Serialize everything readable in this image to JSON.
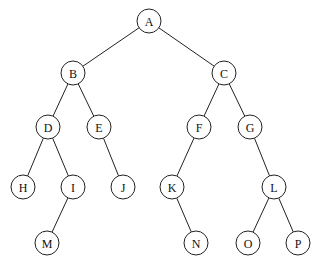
{
  "diagram": {
    "type": "binary-tree",
    "nodes": [
      {
        "id": "A",
        "label": "A",
        "x": 149,
        "y": 21
      },
      {
        "id": "B",
        "label": "B",
        "x": 73,
        "y": 73
      },
      {
        "id": "C",
        "label": "C",
        "x": 224,
        "y": 73
      },
      {
        "id": "D",
        "label": "D",
        "x": 48,
        "y": 127
      },
      {
        "id": "E",
        "label": "E",
        "x": 99,
        "y": 127
      },
      {
        "id": "F",
        "label": "F",
        "x": 199,
        "y": 127
      },
      {
        "id": "G",
        "label": "G",
        "x": 250,
        "y": 127
      },
      {
        "id": "H",
        "label": "H",
        "x": 23,
        "y": 187
      },
      {
        "id": "I",
        "label": "I",
        "x": 73,
        "y": 187
      },
      {
        "id": "J",
        "label": "J",
        "x": 123,
        "y": 187
      },
      {
        "id": "K",
        "label": "K",
        "x": 172,
        "y": 187
      },
      {
        "id": "L",
        "label": "L",
        "x": 274,
        "y": 187
      },
      {
        "id": "M",
        "label": "M",
        "x": 47,
        "y": 243
      },
      {
        "id": "N",
        "label": "N",
        "x": 196,
        "y": 243
      },
      {
        "id": "O",
        "label": "O",
        "x": 248,
        "y": 243
      },
      {
        "id": "P",
        "label": "P",
        "x": 298,
        "y": 243
      }
    ],
    "edges": [
      [
        "A",
        "B"
      ],
      [
        "A",
        "C"
      ],
      [
        "B",
        "D"
      ],
      [
        "B",
        "E"
      ],
      [
        "C",
        "F"
      ],
      [
        "C",
        "G"
      ],
      [
        "D",
        "H"
      ],
      [
        "D",
        "I"
      ],
      [
        "E",
        "J"
      ],
      [
        "F",
        "K"
      ],
      [
        "G",
        "L"
      ],
      [
        "I",
        "M"
      ],
      [
        "K",
        "N"
      ],
      [
        "L",
        "O"
      ],
      [
        "L",
        "P"
      ]
    ],
    "node_radius": 12
  }
}
